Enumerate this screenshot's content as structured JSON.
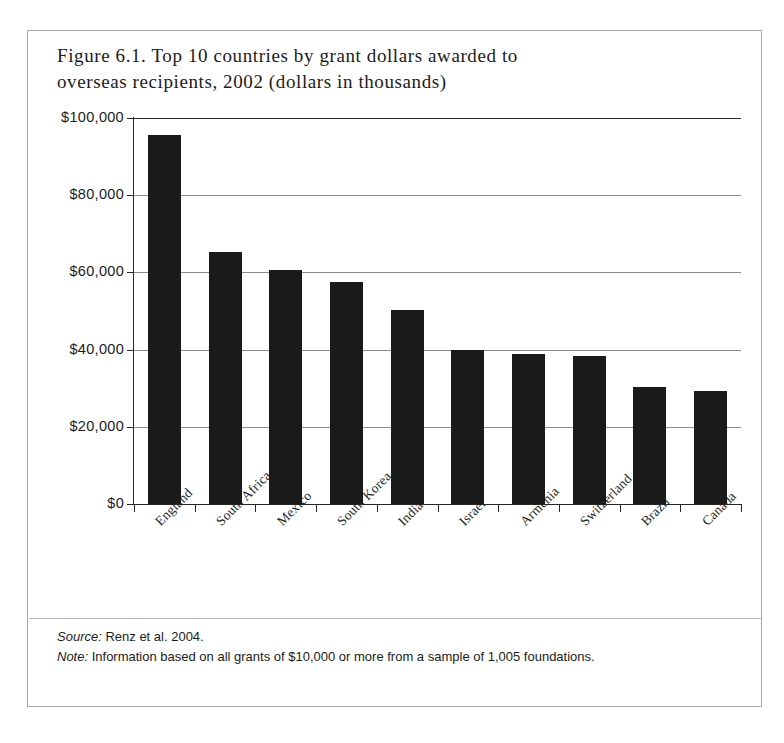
{
  "figure": {
    "title": "Figure 6.1. Top 10 countries by grant dollars awarded to\noverseas recipients, 2002 (dollars in thousands)",
    "source_label": "Source:",
    "source_text": " Renz et al. 2004.",
    "note_label": "Note:",
    "note_text": " Information based on all grants of $10,000 or more from a sample of 1,005 foundations."
  },
  "chart_data": {
    "type": "bar",
    "title": "Figure 6.1. Top 10 countries by grant dollars awarded to overseas recipients, 2002 (dollars in thousands)",
    "xlabel": "",
    "ylabel": "",
    "categories": [
      "England",
      "South Africa",
      "Mexico",
      "South Korea",
      "India",
      "Israel",
      "Armenia",
      "Switzerland",
      "Brazil",
      "Canada"
    ],
    "values": [
      95500,
      65200,
      60500,
      57500,
      50200,
      40000,
      38800,
      38400,
      30300,
      29200
    ],
    "ylim": [
      0,
      100000
    ],
    "yticks": [
      0,
      20000,
      40000,
      60000,
      80000,
      100000
    ],
    "ytick_labels": [
      "$0",
      "$20,000",
      "$40,000",
      "$60,000",
      "$80,000",
      "$100,000"
    ],
    "grid": true,
    "legend": false,
    "bar_color": "#1a1a1a"
  }
}
